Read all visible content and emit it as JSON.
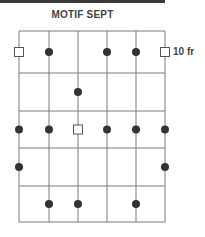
{
  "header": {
    "title": "MOTIF SEPT"
  },
  "diagram": {
    "type": "chord-grid",
    "strings": 6,
    "frets": 5,
    "fret_label": "10 fr",
    "fret_label_row": 1,
    "string_x": [
      19,
      49,
      78,
      107,
      136,
      165
    ],
    "fret_y": [
      31,
      73,
      111,
      148,
      186,
      222
    ],
    "colors": {
      "line": "#7a7a7a",
      "dot": "#333333",
      "square_stroke": "#555555",
      "text": "#444444"
    },
    "markers": [
      {
        "row": 1,
        "string": 1,
        "shape": "square"
      },
      {
        "row": 1,
        "string": 2,
        "shape": "dot"
      },
      {
        "row": 1,
        "string": 4,
        "shape": "dot"
      },
      {
        "row": 1,
        "string": 5,
        "shape": "dot"
      },
      {
        "row": 1,
        "string": 6,
        "shape": "square"
      },
      {
        "row": 2,
        "string": 3,
        "shape": "dot"
      },
      {
        "row": 3,
        "string": 1,
        "shape": "dot"
      },
      {
        "row": 3,
        "string": 2,
        "shape": "dot"
      },
      {
        "row": 3,
        "string": 3,
        "shape": "square"
      },
      {
        "row": 3,
        "string": 4,
        "shape": "dot"
      },
      {
        "row": 3,
        "string": 5,
        "shape": "dot"
      },
      {
        "row": 3,
        "string": 6,
        "shape": "dot"
      },
      {
        "row": 4,
        "string": 1,
        "shape": "dot"
      },
      {
        "row": 4,
        "string": 6,
        "shape": "dot"
      },
      {
        "row": 5,
        "string": 2,
        "shape": "dot"
      },
      {
        "row": 5,
        "string": 3,
        "shape": "dot"
      },
      {
        "row": 5,
        "string": 5,
        "shape": "dot"
      }
    ]
  }
}
